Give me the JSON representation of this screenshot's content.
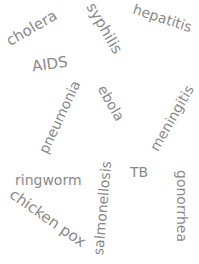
{
  "word_cloud": {
    "text_color": "#8a8a8a",
    "background": "#ffffff",
    "words": [
      {
        "text": "cholera",
        "x": 4,
        "y": 28,
        "size": 15,
        "rotate": -30
      },
      {
        "text": "syphilis",
        "x": 76,
        "y": 28,
        "size": 15,
        "rotate": 60
      },
      {
        "text": "hepatitis",
        "x": 132,
        "y": 18,
        "size": 14,
        "rotate": 18
      },
      {
        "text": "AIDS",
        "x": 32,
        "y": 64,
        "size": 15,
        "rotate": -8
      },
      {
        "text": "pneumonia",
        "x": 20,
        "y": 117,
        "size": 14,
        "rotate": -65
      },
      {
        "text": "ebola",
        "x": 92,
        "y": 103,
        "size": 14,
        "rotate": 60
      },
      {
        "text": "meningitis",
        "x": 135,
        "y": 118,
        "size": 14,
        "rotate": -60
      },
      {
        "text": "TB",
        "x": 130,
        "y": 172,
        "size": 14,
        "rotate": 0
      },
      {
        "text": "ringworm",
        "x": 15,
        "y": 180,
        "size": 14,
        "rotate": 0
      },
      {
        "text": "chicken pox",
        "x": 3,
        "y": 218,
        "size": 15,
        "rotate": 35
      },
      {
        "text": "salmonellosis",
        "x": 55,
        "y": 208,
        "size": 14,
        "rotate": -85
      },
      {
        "text": "gonorrhea",
        "x": 146,
        "y": 206,
        "size": 14,
        "rotate": 90
      }
    ]
  }
}
